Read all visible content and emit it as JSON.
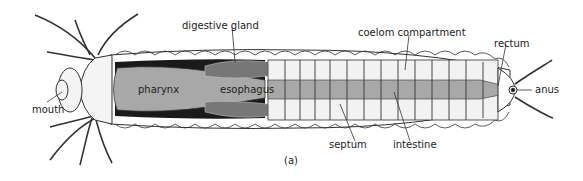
{
  "figure": {
    "caption": "(a)",
    "labels": {
      "digestive_gland": "digestive gland",
      "coelom_compartment": "coelom compartment",
      "rectum": "rectum",
      "mouth": "mouth",
      "pharynx": "pharynx",
      "esophagus": "esophagus",
      "anus": "anus",
      "septum": "septum",
      "intestine": "intestine"
    },
    "colors": {
      "outline": "#222222",
      "gut_gray": "#a8a8a8",
      "dark_tissue": "#1a1a1a",
      "coelom_fill": "#f2f2f2"
    }
  }
}
